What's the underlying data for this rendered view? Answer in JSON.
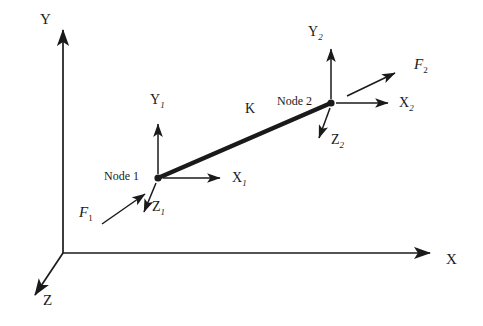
{
  "figure": {
    "background_color": "#ffffff",
    "stroke_color": "#1a1a1a"
  },
  "global_axes": {
    "x": {
      "label": "X",
      "label_x": 446,
      "label_y": 252,
      "from": [
        63,
        253
      ],
      "to": [
        432,
        253
      ]
    },
    "y": {
      "label": "Y",
      "label_x": 40,
      "label_y": 12,
      "from": [
        63,
        253
      ],
      "to": [
        63,
        27
      ]
    },
    "z": {
      "label": "Z",
      "label_x": 43,
      "label_y": 293,
      "from": [
        63,
        253
      ],
      "to": [
        32,
        299
      ]
    }
  },
  "element": {
    "stiffness_label": "K",
    "stiffness_label_x": 245,
    "stiffness_label_y": 102,
    "from": [
      158,
      178
    ],
    "to": [
      331,
      103
    ],
    "thickness": 4.5
  },
  "nodes": [
    {
      "name": "Node 1",
      "label": "Node 1",
      "label_x": 104,
      "label_y": 170,
      "point": [
        158,
        178
      ],
      "local_axes": [
        {
          "axis": "X",
          "sub": "1",
          "label": "X",
          "subscript": "1",
          "label_x": 232,
          "label_y": 171,
          "from": [
            163,
            178
          ],
          "to": [
            222,
            178
          ]
        },
        {
          "axis": "Y",
          "sub": "1",
          "label": "Y",
          "subscript": "1",
          "label_x": 150,
          "label_y": 93,
          "from": [
            158,
            173
          ],
          "to": [
            158,
            122
          ]
        },
        {
          "axis": "Z",
          "sub": "1",
          "label": "Z",
          "subscript": "1",
          "label_x": 152,
          "label_y": 200,
          "from": [
            156,
            183
          ],
          "to": [
            143,
            215
          ]
        }
      ],
      "force": {
        "label": "F",
        "subscript": "1",
        "label_x": 79,
        "label_y": 205,
        "from": [
          102,
          224
        ],
        "to": [
          146,
          193
        ]
      }
    },
    {
      "name": "Node 2",
      "label": "Node 2",
      "label_x": 277,
      "label_y": 95,
      "point": [
        331,
        103
      ],
      "local_axes": [
        {
          "axis": "X",
          "sub": "2",
          "label": "X",
          "subscript": "2",
          "label_x": 399,
          "label_y": 96,
          "from": [
            336,
            103
          ],
          "to": [
            390,
            103
          ]
        },
        {
          "axis": "Y",
          "sub": "2",
          "label": "Y",
          "subscript": "2",
          "label_x": 308,
          "label_y": 25,
          "from": [
            331,
            98
          ],
          "to": [
            331,
            47
          ]
        },
        {
          "axis": "Z",
          "sub": "2",
          "label": "Z",
          "subscript": "2",
          "label_x": 331,
          "label_y": 133,
          "from": [
            330,
            108
          ],
          "to": [
            318,
            141
          ]
        }
      ],
      "force": {
        "label": "F",
        "subscript": "2",
        "label_x": 414,
        "label_y": 57,
        "from": [
          347,
          96
        ],
        "to": [
          397,
          72
        ]
      }
    }
  ]
}
